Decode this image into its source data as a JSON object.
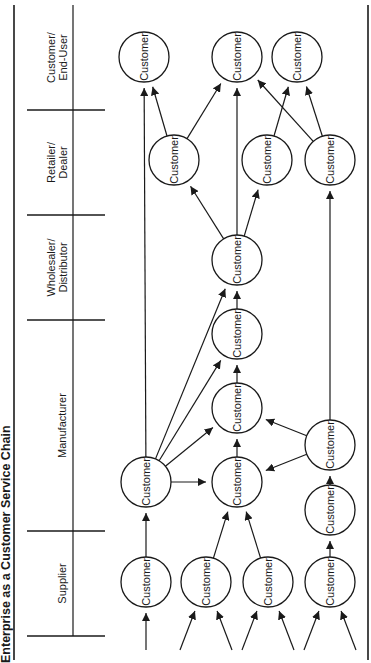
{
  "title": "Enterprise as a Customer Service Chain",
  "orientation": "rotated-90-ccw",
  "colors": {
    "ink": "#1a1a1a",
    "background": "#ffffff"
  },
  "columns": [
    {
      "id": "supplier",
      "line1": "Supplier",
      "line2": "",
      "y_start": 531,
      "y_end": 636
    },
    {
      "id": "manufacturer",
      "line1": "Manufacturer",
      "line2": "",
      "y_start": 320,
      "y_end": 531
    },
    {
      "id": "wholesaler",
      "line1": "Wholesaler/",
      "line2": "Distributor",
      "y_start": 215,
      "y_end": 320
    },
    {
      "id": "retailer",
      "line1": "Retailer/",
      "line2": "Dealer",
      "y_start": 110,
      "y_end": 215
    },
    {
      "id": "end-user",
      "line1": "Customer/",
      "line2": "End-User",
      "y_start": 5,
      "y_end": 110
    }
  ],
  "node_label": "Customer",
  "nodes": [
    {
      "id": "s1",
      "column": "supplier",
      "x": 146,
      "y": 582
    },
    {
      "id": "s2",
      "column": "supplier",
      "x": 206,
      "y": 582
    },
    {
      "id": "s3",
      "column": "supplier",
      "x": 268,
      "y": 582
    },
    {
      "id": "s4",
      "column": "supplier",
      "x": 330,
      "y": 582
    },
    {
      "id": "m1",
      "column": "manufacturer",
      "x": 146,
      "y": 482
    },
    {
      "id": "m2",
      "column": "manufacturer",
      "x": 237,
      "y": 482
    },
    {
      "id": "m3",
      "column": "manufacturer",
      "x": 237,
      "y": 408
    },
    {
      "id": "m4",
      "column": "manufacturer",
      "x": 237,
      "y": 334
    },
    {
      "id": "m5",
      "column": "manufacturer",
      "x": 330,
      "y": 510
    },
    {
      "id": "m6",
      "column": "manufacturer",
      "x": 330,
      "y": 445
    },
    {
      "id": "w1",
      "column": "wholesaler",
      "x": 237,
      "y": 260
    },
    {
      "id": "r1",
      "column": "retailer",
      "x": 174,
      "y": 160
    },
    {
      "id": "r2",
      "column": "retailer",
      "x": 267,
      "y": 160
    },
    {
      "id": "r3",
      "column": "retailer",
      "x": 330,
      "y": 160
    },
    {
      "id": "e1",
      "column": "end-user",
      "x": 144,
      "y": 57
    },
    {
      "id": "e2",
      "column": "end-user",
      "x": 237,
      "y": 57
    },
    {
      "id": "e3",
      "column": "end-user",
      "x": 297,
      "y": 57
    }
  ],
  "edges": [
    {
      "from": "s1",
      "to": "m1"
    },
    {
      "from": "s2",
      "to": "m2"
    },
    {
      "from": "s3",
      "to": "m2"
    },
    {
      "from": "s4",
      "to": "m5"
    },
    {
      "from": "m1",
      "to": "m2"
    },
    {
      "from": "m1",
      "to": "m3"
    },
    {
      "from": "m1",
      "to": "m4"
    },
    {
      "from": "m1",
      "to": "w1"
    },
    {
      "from": "m1",
      "to": "e1"
    },
    {
      "from": "m2",
      "to": "m3"
    },
    {
      "from": "m3",
      "to": "m4"
    },
    {
      "from": "m4",
      "to": "w1"
    },
    {
      "from": "m5",
      "to": "m6"
    },
    {
      "from": "m6",
      "to": "m2"
    },
    {
      "from": "m6",
      "to": "m3"
    },
    {
      "from": "m6",
      "to": "r3"
    },
    {
      "from": "w1",
      "to": "r1"
    },
    {
      "from": "w1",
      "to": "r2"
    },
    {
      "from": "w1",
      "to": "e2"
    },
    {
      "from": "r1",
      "to": "e1"
    },
    {
      "from": "r1",
      "to": "e2"
    },
    {
      "from": "r2",
      "to": "e3"
    },
    {
      "from": "r3",
      "to": "e2"
    },
    {
      "from": "r3",
      "to": "e3"
    }
  ],
  "incoming_arrows": [
    {
      "from_x": 146,
      "from_y": 650,
      "to": "s1"
    },
    {
      "from_x": 180,
      "from_y": 650,
      "to": "s2"
    },
    {
      "from_x": 232,
      "from_y": 650,
      "to": "s2"
    },
    {
      "from_x": 242,
      "from_y": 650,
      "to": "s3"
    },
    {
      "from_x": 294,
      "from_y": 650,
      "to": "s3"
    },
    {
      "from_x": 304,
      "from_y": 650,
      "to": "s4"
    },
    {
      "from_x": 356,
      "from_y": 650,
      "to": "s4"
    }
  ]
}
